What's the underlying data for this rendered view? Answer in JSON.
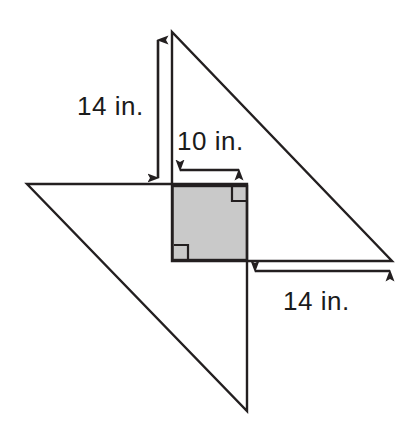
{
  "figure": {
    "background_color": "#ffffff",
    "stroke_color": "#231f20",
    "shaded_fill_color": "#c9c9c9",
    "label_color": "#1b1b1b",
    "units": "in."
  },
  "labels": {
    "height_14": "14 in.",
    "square_side_10": "10 in.",
    "base_14": "14 in."
  },
  "measurements": [
    {
      "name": "upper-triangle-height",
      "value": 14,
      "unit": "in.",
      "text": "14 in.",
      "orientation": "vertical"
    },
    {
      "name": "square-side",
      "value": 10,
      "unit": "in.",
      "text": "10 in.",
      "orientation": "horizontal"
    },
    {
      "name": "lower-base-segment",
      "value": 14,
      "unit": "in.",
      "text": "14 in.",
      "orientation": "horizontal"
    }
  ],
  "shapes": {
    "upper_triangle": {
      "name": "upper-right-triangle",
      "points": "172,32 172,261 392,261",
      "fill": "none"
    },
    "lower_triangle": {
      "name": "lower-right-triangle",
      "points": "27,184 247,184 247,411",
      "fill": "none"
    },
    "shaded_square": {
      "name": "shaded-overlap-square",
      "x": 172,
      "y": 186,
      "width": 75,
      "height": 74,
      "fill": "#c9c9c9"
    },
    "right_angle_marks": [
      {
        "name": "right-angle-mark-top-right",
        "points": "232,186 232,200 246,200"
      },
      {
        "name": "right-angle-mark-bottom-left",
        "points": "173,246 187,246 187,259"
      }
    ]
  },
  "dimension_lines": {
    "vertical_height": {
      "name": "height-dimension-arrow",
      "x": 158,
      "y1": 32,
      "y2": 186
    },
    "top_horizontal": {
      "name": "square-width-dimension-arrow",
      "y": 170,
      "x1": 172,
      "x2": 247
    },
    "bottom_horizontal": {
      "name": "base-dimension-arrow",
      "y": 271,
      "x1": 247,
      "x2": 398
    }
  }
}
